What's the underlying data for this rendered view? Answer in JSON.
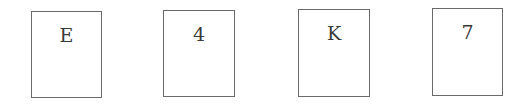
{
  "cards": [
    {
      "label": "E"
    },
    {
      "label": "4"
    },
    {
      "label": "K"
    },
    {
      "label": "7"
    }
  ]
}
